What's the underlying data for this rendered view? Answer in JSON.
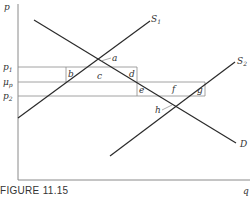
{
  "figure": {
    "caption": "FIGURE 11.15",
    "axes": {
      "y_label": "p",
      "x_label": "q"
    },
    "price_levels": [
      {
        "name": "p1",
        "label": "p",
        "sub": "1"
      },
      {
        "name": "mu_p",
        "label": "μ",
        "sub": "p"
      },
      {
        "name": "p2",
        "label": "p",
        "sub": "2"
      }
    ],
    "curves": [
      {
        "name": "S1",
        "label": "S",
        "sub": "1"
      },
      {
        "name": "S2",
        "label": "S",
        "sub": "2"
      },
      {
        "name": "D",
        "label": "D"
      }
    ],
    "areas": {
      "a": "a",
      "b": "b",
      "c": "c",
      "d": "d",
      "e": "e",
      "f": "f",
      "g": "g",
      "h": "h"
    },
    "colors": {
      "line": "#2a2a2a",
      "thin": "#8a8a8a",
      "text": "#333333"
    }
  }
}
